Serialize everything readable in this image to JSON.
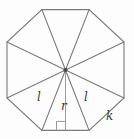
{
  "figure": {
    "shape": "regular-octagon",
    "triangle_count": 8,
    "background_color": "#fdfdfd",
    "stroke_color": "#7a7a7a",
    "label_color": "#3a3a3a",
    "right_angle_marker": true
  },
  "labels": {
    "slant_left": "l",
    "apothem": "r",
    "slant_right": "l",
    "side": "k"
  },
  "geometry": {
    "center": {
      "x": 65.5,
      "y": 70.0
    },
    "circumradius": 63.0,
    "vertices": [
      {
        "x": 41.9,
        "y": 9.6
      },
      {
        "x": 89.1,
        "y": 9.6
      },
      {
        "x": 124.0,
        "y": 42.0
      },
      {
        "x": 124.0,
        "y": 98.0
      },
      {
        "x": 89.1,
        "y": 130.4
      },
      {
        "x": 41.9,
        "y": 130.4
      },
      {
        "x": 7.0,
        "y": 98.0
      },
      {
        "x": 7.0,
        "y": 42.0
      }
    ],
    "apothem_foot": {
      "x": 65.5,
      "y": 130.4
    },
    "right_angle_size": 9
  },
  "label_positions": {
    "slant_left": {
      "x": 37,
      "y": 91
    },
    "apothem": {
      "x": 61,
      "y": 100
    },
    "slant_right": {
      "x": 84,
      "y": 91
    },
    "side": {
      "x": 106,
      "y": 110
    }
  }
}
